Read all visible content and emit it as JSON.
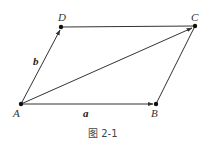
{
  "figure": {
    "caption": "图 2-1",
    "points": {
      "A": {
        "label": "A"
      },
      "B": {
        "label": "B"
      },
      "C": {
        "label": "C"
      },
      "D": {
        "label": "D"
      }
    },
    "vectors": {
      "a": {
        "label": "a",
        "from": "A",
        "to": "B"
      },
      "b": {
        "label": "b",
        "from": "A",
        "to": "D"
      },
      "diag": {
        "label": "",
        "from": "A",
        "to": "C"
      }
    },
    "segments": [
      {
        "from": "D",
        "to": "C"
      },
      {
        "from": "B",
        "to": "C"
      }
    ],
    "stroke_color": "#333333"
  }
}
